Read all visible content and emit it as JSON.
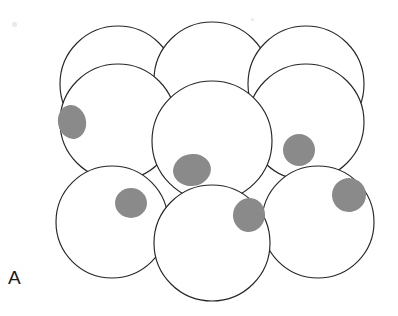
{
  "figure": {
    "panel_label": "A",
    "background_color": "#ffffff",
    "cell_outline_color": "#262626",
    "cell_fill_color": "#ffffff",
    "nucleus_color": "#8a8a8a",
    "label_color": "#1a1a1a",
    "canvas": {
      "width": 398,
      "height": 316
    }
  },
  "cells": [
    {
      "id": "cell-back-top-left",
      "cx": 118,
      "cy": 84,
      "r": 58,
      "layer": "back",
      "has_nucleus": false
    },
    {
      "id": "cell-back-top-center",
      "cx": 212,
      "cy": 80,
      "r": 58,
      "layer": "back",
      "has_nucleus": false
    },
    {
      "id": "cell-back-top-right",
      "cx": 306,
      "cy": 84,
      "r": 58,
      "layer": "back",
      "has_nucleus": false
    },
    {
      "id": "cell-mid-left",
      "cx": 118,
      "cy": 122,
      "r": 58,
      "layer": "front",
      "has_nucleus": true
    },
    {
      "id": "cell-mid-right",
      "cx": 306,
      "cy": 122,
      "r": 58,
      "layer": "front",
      "has_nucleus": true
    },
    {
      "id": "cell-bottom-left",
      "cx": 112,
      "cy": 222,
      "r": 56,
      "layer": "front",
      "has_nucleus": true
    },
    {
      "id": "cell-bottom-right",
      "cx": 318,
      "cy": 222,
      "r": 56,
      "layer": "front",
      "has_nucleus": true
    },
    {
      "id": "cell-center",
      "cx": 212,
      "cy": 141,
      "r": 60,
      "layer": "front",
      "has_nucleus": true
    },
    {
      "id": "cell-bottom-center",
      "cx": 212,
      "cy": 243,
      "r": 58,
      "layer": "front",
      "has_nucleus": true
    }
  ],
  "nuclei": [
    {
      "id": "nucleus-mid-left",
      "cx": 72,
      "cy": 122,
      "rx": 14,
      "ry": 17,
      "rotate": -12
    },
    {
      "id": "nucleus-center",
      "cx": 192,
      "cy": 170,
      "rx": 19,
      "ry": 16,
      "rotate": -8
    },
    {
      "id": "nucleus-mid-right",
      "cx": 299,
      "cy": 150,
      "rx": 16,
      "ry": 16,
      "rotate": 0
    },
    {
      "id": "nucleus-bottom-left",
      "cx": 131,
      "cy": 203,
      "rx": 16,
      "ry": 15,
      "rotate": 0
    },
    {
      "id": "nucleus-bottom-center",
      "cx": 249,
      "cy": 215,
      "rx": 16,
      "ry": 17,
      "rotate": 10
    },
    {
      "id": "nucleus-bottom-right",
      "cx": 349,
      "cy": 195,
      "rx": 17,
      "ry": 17,
      "rotate": -10
    }
  ],
  "specks": [
    {
      "id": "speck-top-left",
      "x": 12,
      "y": 22,
      "size": 5
    },
    {
      "id": "speck-top-right",
      "x": 251,
      "y": 18,
      "size": 3
    }
  ]
}
